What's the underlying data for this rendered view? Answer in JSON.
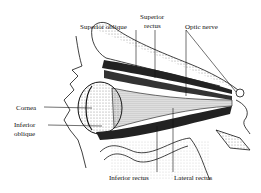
{
  "diagram": {
    "labels": {
      "superior_oblique": "Superior oblique",
      "superior_rectus_line1": "Superior",
      "superior_rectus_line2": "rectus",
      "optic_nerve": "Optic nerve",
      "cornea": "Cornea",
      "inferior_oblique_line1": "Inferior",
      "inferior_oblique_line2": "oblique",
      "inferior_rectus": "Inferior rectus",
      "lateral_rectus": "Lateral rectus"
    },
    "colors": {
      "ink": "#111111",
      "background": "#ffffff",
      "stipple": "#8a8a8a"
    }
  }
}
